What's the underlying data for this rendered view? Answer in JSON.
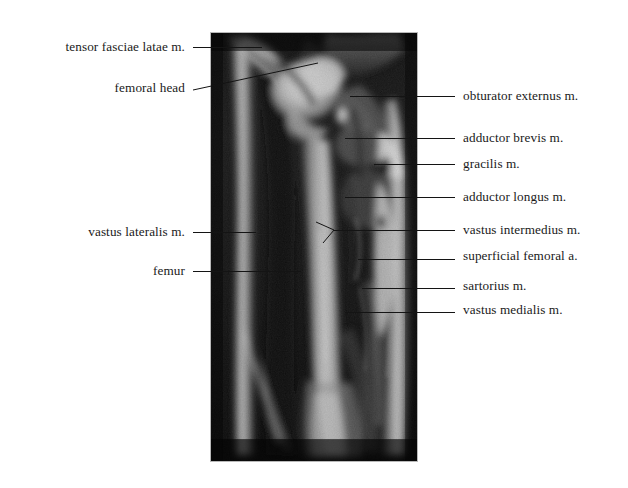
{
  "figure": {
    "type": "annotated-mri",
    "modality": "MRI",
    "view": "coronal",
    "region": "thigh",
    "background_color": "#ffffff",
    "text_color": "#1a1a1a",
    "leader_color": "#141414"
  },
  "image_panel": {
    "name": "coronal-thigh-mri",
    "x": 210,
    "y": 32,
    "width": 208,
    "height": 430,
    "border_color": "#b9b9b9",
    "background_color": "#0a0a0a"
  },
  "labels_left": [
    {
      "id": "tensor-fasciae-latae",
      "text": "tensor fasciae latae  m.",
      "text_x": 185,
      "text_y": 47,
      "line": {
        "x1": 193,
        "y1": 47,
        "x2": 262,
        "y2": 47
      }
    },
    {
      "id": "femoral-head",
      "text": "femoral head",
      "text_x": 185,
      "text_y": 88,
      "line": {
        "x1": 193,
        "y1": 90,
        "x2": 318,
        "y2": 63
      }
    },
    {
      "id": "vastus-lateralis",
      "text": "vastus lateralis m.",
      "text_x": 185,
      "text_y": 232,
      "line": {
        "x1": 193,
        "y1": 232,
        "x2": 256,
        "y2": 229
      }
    },
    {
      "id": "femur",
      "text": "femur",
      "text_x": 185,
      "text_y": 271,
      "line": {
        "x1": 193,
        "y1": 271,
        "x2": 301,
        "y2": 270
      }
    }
  ],
  "labels_right": [
    {
      "id": "obturator-externus",
      "text": "obturator externus m.",
      "text_x": 463,
      "text_y": 96,
      "line": {
        "x1": 350,
        "y1": 96,
        "x2": 455,
        "y2": 96
      }
    },
    {
      "id": "adductor-brevis",
      "text": "adductor brevis m.",
      "text_x": 463,
      "text_y": 138,
      "line": {
        "x1": 345,
        "y1": 138,
        "x2": 455,
        "y2": 138
      }
    },
    {
      "id": "gracilis",
      "text": "gracilis  m.",
      "text_x": 463,
      "text_y": 164,
      "line": {
        "x1": 374,
        "y1": 164,
        "x2": 455,
        "y2": 164
      }
    },
    {
      "id": "adductor-longus",
      "text": "adductor longus m.",
      "text_x": 463,
      "text_y": 197,
      "line": {
        "x1": 345,
        "y1": 197,
        "x2": 455,
        "y2": 197
      }
    },
    {
      "id": "vastus-intermedius",
      "text": "vastus intermedius m.",
      "text_x": 463,
      "text_y": 230,
      "line": {
        "x1": 334,
        "y1": 230,
        "x2": 455,
        "y2": 230
      }
    },
    {
      "id": "superficial-femoral-a",
      "text": "superficial  femoral a.",
      "text_x": 463,
      "text_y": 256,
      "line": {
        "x1": 358,
        "y1": 259,
        "x2": 455,
        "y2": 259
      }
    },
    {
      "id": "sartorius",
      "text": "sartorius m.",
      "text_x": 463,
      "text_y": 286,
      "line": {
        "x1": 362,
        "y1": 288,
        "x2": 455,
        "y2": 288
      }
    },
    {
      "id": "vastus-medialis",
      "text": "vastus medialis m.",
      "text_x": 463,
      "text_y": 310,
      "line": {
        "x1": 345,
        "y1": 312,
        "x2": 455,
        "y2": 312
      }
    }
  ],
  "pointer_fork": {
    "id": "vastus-intermedius-fork",
    "vertex_x": 334,
    "vertex_y": 230,
    "branch_a": {
      "x": 316,
      "y": 222
    },
    "branch_b": {
      "x": 323,
      "y": 243
    }
  }
}
